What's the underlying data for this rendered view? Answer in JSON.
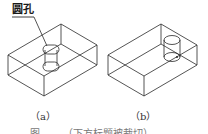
{
  "figure": {
    "callout": {
      "label": "圆孔"
    },
    "panels": [
      {
        "id": "a",
        "caption": "（a）",
        "description": "Isometric wireframe of rectangular block with a through hole (cylindrical round hole) indicated by callout"
      },
      {
        "id": "b",
        "caption": "（b）",
        "description": "Isometric wireframe of rectangular block with cylindrical hole drawn near right side"
      }
    ],
    "caption_partial": "图 ……（下方标题被裁切）"
  },
  "colors": {
    "line": "#2a2a2a",
    "background": "#ffffff"
  }
}
